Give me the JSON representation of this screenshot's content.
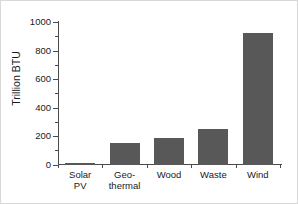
{
  "chart_data": {
    "type": "bar",
    "title": "",
    "xlabel": "",
    "ylabel": "Trillion BTU",
    "categories": [
      "Solar PV",
      "Geo-thermal",
      "Wood",
      "Waste",
      "Wind"
    ],
    "category_label_lines": [
      [
        "Solar",
        "PV"
      ],
      [
        "Geo-",
        "thermal"
      ],
      [
        "Wood"
      ],
      [
        "Waste"
      ],
      [
        "Wind"
      ]
    ],
    "values": [
      12,
      152,
      188,
      250,
      925
    ],
    "ylim": [
      0,
      1000
    ],
    "ytick_values": [
      0,
      200,
      400,
      600,
      800,
      1000
    ],
    "ytick_labels": [
      "0",
      "200",
      "400",
      "600",
      "800",
      "1000"
    ],
    "yminor_tick_values": [
      100,
      300,
      500,
      700,
      900
    ],
    "grid": false,
    "legend": false,
    "legend_position": "none",
    "bar_color": "#585858",
    "axis_color": "#4a4a4a",
    "text_color": "#1a1a1a",
    "background": "#ffffff",
    "frame_color": "#d8d8d8"
  }
}
